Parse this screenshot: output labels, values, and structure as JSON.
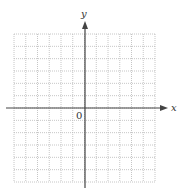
{
  "diagram": {
    "type": "coordinate-grid",
    "axes": {
      "x_label": "x",
      "y_label": "y",
      "origin_label": "0"
    },
    "grid": {
      "columns": 12,
      "rows": 12,
      "columns_left_of_y_axis": 6,
      "rows_above_x_axis": 6,
      "line_style": "dotted",
      "line_color": "#b8b8b8"
    },
    "axis_color": "#444444"
  }
}
